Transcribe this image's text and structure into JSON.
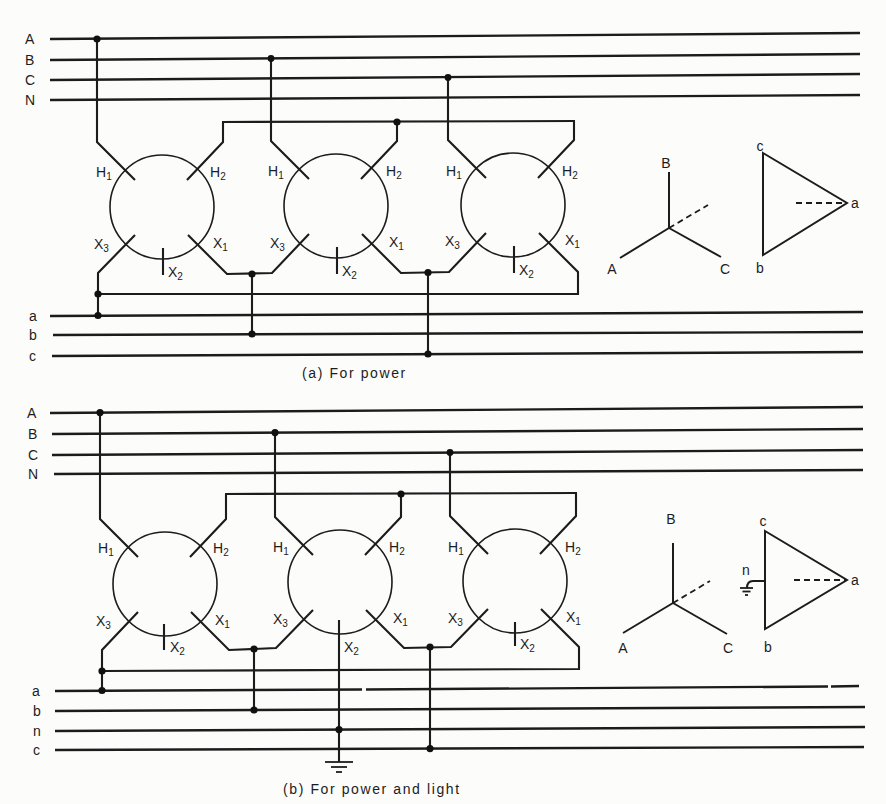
{
  "figure": {
    "panel_a": {
      "caption": "(a) For power",
      "primary_buses": [
        "A",
        "B",
        "C",
        "N"
      ],
      "secondary_buses": [
        "a",
        "b",
        "c"
      ],
      "transformers": [
        {
          "H1": {
            "letter": "H",
            "sub": "1"
          },
          "H2": {
            "letter": "H",
            "sub": "2"
          },
          "X1": {
            "letter": "X",
            "sub": "1"
          },
          "X2": {
            "letter": "X",
            "sub": "2"
          },
          "X3": {
            "letter": "X",
            "sub": "3"
          }
        },
        {
          "H1": {
            "letter": "H",
            "sub": "1"
          },
          "H2": {
            "letter": "H",
            "sub": "2"
          },
          "X1": {
            "letter": "X",
            "sub": "1"
          },
          "X2": {
            "letter": "X",
            "sub": "2"
          },
          "X3": {
            "letter": "X",
            "sub": "3"
          }
        },
        {
          "H1": {
            "letter": "H",
            "sub": "1"
          },
          "H2": {
            "letter": "H",
            "sub": "2"
          },
          "X1": {
            "letter": "X",
            "sub": "1"
          },
          "X2": {
            "letter": "X",
            "sub": "2"
          },
          "X3": {
            "letter": "X",
            "sub": "3"
          }
        }
      ],
      "phasor": {
        "wye_labels": {
          "A": "A",
          "B": "B",
          "C": "C"
        },
        "delta_labels": {
          "a": "a",
          "b": "b",
          "c": "c"
        }
      }
    },
    "panel_b": {
      "caption": "(b) For power and light",
      "primary_buses": [
        "A",
        "B",
        "C",
        "N"
      ],
      "secondary_buses": [
        "a",
        "b",
        "n",
        "c"
      ],
      "transformers": [
        {
          "H1": {
            "letter": "H",
            "sub": "1"
          },
          "H2": {
            "letter": "H",
            "sub": "2"
          },
          "X1": {
            "letter": "X",
            "sub": "1"
          },
          "X2": {
            "letter": "X",
            "sub": "2"
          },
          "X3": {
            "letter": "X",
            "sub": "3"
          }
        },
        {
          "H1": {
            "letter": "H",
            "sub": "1"
          },
          "H2": {
            "letter": "H",
            "sub": "2"
          },
          "X1": {
            "letter": "X",
            "sub": "1"
          },
          "X2": {
            "letter": "X",
            "sub": "2"
          },
          "X3": {
            "letter": "X",
            "sub": "3"
          }
        },
        {
          "H1": {
            "letter": "H",
            "sub": "1"
          },
          "H2": {
            "letter": "H",
            "sub": "2"
          },
          "X1": {
            "letter": "X",
            "sub": "1"
          },
          "X2": {
            "letter": "X",
            "sub": "2"
          },
          "X3": {
            "letter": "X",
            "sub": "3"
          }
        }
      ],
      "phasor": {
        "wye_labels": {
          "A": "A",
          "B": "B",
          "C": "C"
        },
        "delta_labels": {
          "a": "a",
          "b": "b",
          "c": "c"
        },
        "neutral_label": "n"
      }
    }
  },
  "colors": {
    "ink": "#1c1c1c",
    "paper": "#fcfcfb"
  }
}
